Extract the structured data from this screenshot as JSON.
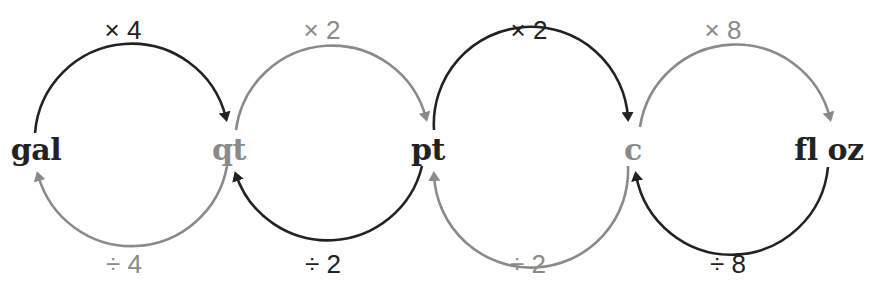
{
  "colors": {
    "dark": "#222222",
    "gray": "#8a8a8a"
  },
  "units": [
    {
      "label": "gal",
      "tone": "dark"
    },
    {
      "label": "qt",
      "tone": "gray"
    },
    {
      "label": "pt",
      "tone": "dark"
    },
    {
      "label": "c",
      "tone": "gray"
    },
    {
      "label": "fl oz",
      "tone": "dark"
    }
  ],
  "multiply": [
    {
      "label": "× 4",
      "from": "gal",
      "to": "qt",
      "tone": "dark"
    },
    {
      "label": "× 2",
      "from": "qt",
      "to": "pt",
      "tone": "gray"
    },
    {
      "label": "× 2",
      "from": "pt",
      "to": "c",
      "tone": "dark"
    },
    {
      "label": "× 8",
      "from": "c",
      "to": "fl oz",
      "tone": "gray"
    }
  ],
  "divide": [
    {
      "label": "÷ 4",
      "from": "qt",
      "to": "gal",
      "tone": "gray"
    },
    {
      "label": "÷ 2",
      "from": "pt",
      "to": "qt",
      "tone": "dark"
    },
    {
      "label": "÷ 2",
      "from": "c",
      "to": "pt",
      "tone": "gray"
    },
    {
      "label": "÷ 8",
      "from": "fl oz",
      "to": "c",
      "tone": "dark"
    }
  ]
}
